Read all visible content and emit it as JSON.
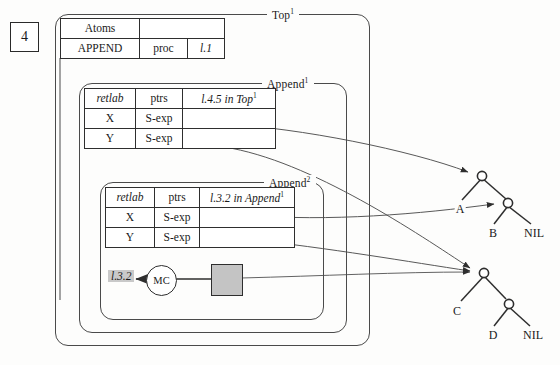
{
  "figure": {
    "number": "4"
  },
  "frames": [
    {
      "id": "top",
      "label": "Top",
      "sup": "1"
    },
    {
      "id": "app1",
      "label": "Append",
      "sup": "1"
    },
    {
      "id": "app2",
      "label": "Append",
      "sup": "2"
    }
  ],
  "atoms_table": {
    "header": {
      "name": "Atoms",
      "hatched": ""
    },
    "row": {
      "name": "APPEND",
      "kind": "proc",
      "label": "l.1"
    }
  },
  "append1_table": {
    "headers": {
      "retlab": "retlab",
      "ptrs": "ptrs",
      "ret": "l.4.5 in Top",
      "ret_sup": "1"
    },
    "rows": [
      {
        "retlab": "X",
        "ptrs": "S-exp",
        "value": ""
      },
      {
        "retlab": "Y",
        "ptrs": "S-exp",
        "value": ""
      }
    ]
  },
  "append2_table": {
    "headers": {
      "retlab": "retlab",
      "ptrs": "ptrs",
      "ret": "l.3.2 in Append",
      "ret_sup": "1"
    },
    "rows": [
      {
        "retlab": "X",
        "ptrs": "S-exp",
        "value": ""
      },
      {
        "retlab": "Y",
        "ptrs": "S-exp",
        "value": ""
      }
    ]
  },
  "mc_row": {
    "return_label": "l.3.2",
    "node_label": "MC",
    "cell_value": ""
  },
  "trees": [
    {
      "id": "upper",
      "leaves": [
        {
          "text": "A"
        },
        {
          "text": "B"
        },
        {
          "text": "NIL"
        }
      ]
    },
    {
      "id": "lower",
      "leaves": [
        {
          "text": "C"
        },
        {
          "text": "D"
        },
        {
          "text": "NIL"
        }
      ]
    }
  ],
  "colors": {
    "ink": "#2e2e2e",
    "frame_line": "#4a4a4a",
    "arc_line": "#555555",
    "gray_fill": "#c4c4c4",
    "highlight": "#c9c9c9",
    "paper": "#fdfdfc"
  }
}
